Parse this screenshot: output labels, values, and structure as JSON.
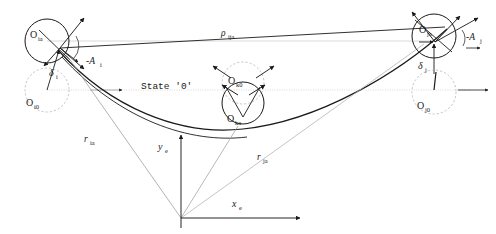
{
  "figure": {
    "title_text": "State '0'",
    "state_label": "State '0'",
    "colors": {
      "ink": "#1a1a1a",
      "faint": "#b9b9b9",
      "mid_gray": "#8f8f8f",
      "background": "#ffffff"
    }
  },
  "bodies": {
    "i_current": {
      "label_base": "O",
      "label_sub": "ia",
      "cx": 47,
      "cy": 41,
      "r": 22,
      "style": "solid"
    },
    "i_initial": {
      "label_base": "O",
      "label_sub": "i0",
      "cx": 47,
      "cy": 90,
      "r": 22,
      "style": "dashed"
    },
    "k_current": {
      "label_base": "O",
      "label_sub": "ka",
      "cx": 243,
      "cy": 103,
      "r": 21,
      "style": "solid"
    },
    "k_initial": {
      "label_base": "O",
      "label_sub": "k0",
      "cx": 243,
      "cy": 83,
      "r": 21,
      "style": "dashed"
    },
    "j_current": {
      "label_base": "O",
      "label_sub": "ja",
      "cx": 434,
      "cy": 36,
      "r": 22,
      "style": "solid"
    },
    "j_initial": {
      "label_base": "O",
      "label_sub": "j0",
      "cx": 434,
      "cy": 92,
      "r": 22,
      "style": "dashed"
    }
  },
  "annotations": {
    "rho": {
      "base": "ρ",
      "sub": "ija",
      "x": 222,
      "y": 34
    },
    "state": {
      "text": "State '0'",
      "x": 142,
      "y": 86
    },
    "A_i": {
      "base": "-ᴀ",
      "glyph": "-A",
      "sub": "i",
      "x": 88,
      "y": 62
    },
    "A_j": {
      "base": "-ᴀ",
      "glyph": "-A",
      "sub": "j",
      "x": 470,
      "y": 42
    },
    "delta_i": {
      "base": "δ",
      "sub": "i",
      "x": 51,
      "y": 74
    },
    "delta_j": {
      "base": "δ",
      "sub": "j",
      "x": 420,
      "y": 68
    },
    "r_ia": {
      "base": "r",
      "sub": "ia",
      "x": 85,
      "y": 140
    },
    "r_ja": {
      "base": "r",
      "sub": "ja",
      "x": 258,
      "y": 158
    },
    "x_axis": {
      "base": "x",
      "sub": "e",
      "x": 235,
      "y": 205
    },
    "y_axis": {
      "base": "y",
      "sub": "e",
      "x": 161,
      "y": 148
    }
  },
  "axes": {
    "origin": {
      "x": 181,
      "y": 218
    },
    "x_end": {
      "x": 300,
      "y": 218
    },
    "y_end": {
      "x": 181,
      "y": 135
    },
    "x_label": "x",
    "x_sub": "e",
    "y_label": "y",
    "y_sub": "e"
  },
  "vectors": {
    "r_ia_label": "r",
    "r_ia_sub": "ia",
    "r_ja_label": "r",
    "r_ja_sub": "ja",
    "rho_label": "ρ",
    "rho_sub": "ija"
  }
}
